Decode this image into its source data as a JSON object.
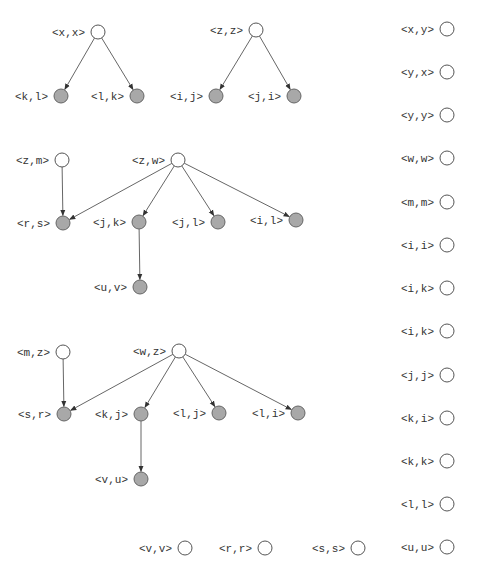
{
  "colors": {
    "filled_node": "#a8a8a8",
    "empty_node": "#ffffff",
    "edge": "#555555",
    "text": "#333333"
  },
  "nodes": [
    {
      "id": "xx",
      "label": "<x,x>",
      "x": 98,
      "y": 32,
      "filled": false
    },
    {
      "id": "kl",
      "label": "<k,l>",
      "x": 61,
      "y": 96,
      "filled": true
    },
    {
      "id": "lk",
      "label": "<l,k>",
      "x": 137,
      "y": 96,
      "filled": true
    },
    {
      "id": "zz",
      "label": "<z,z>",
      "x": 256,
      "y": 30,
      "filled": false
    },
    {
      "id": "ij",
      "label": "<i,j>",
      "x": 216,
      "y": 96,
      "filled": true
    },
    {
      "id": "ji",
      "label": "<j,i>",
      "x": 294,
      "y": 96,
      "filled": true
    },
    {
      "id": "zm",
      "label": "<z,m>",
      "x": 62,
      "y": 160,
      "filled": false
    },
    {
      "id": "zw",
      "label": "<z,w>",
      "x": 178,
      "y": 160,
      "filled": false
    },
    {
      "id": "rs",
      "label": "<r,s>",
      "x": 63,
      "y": 223,
      "filled": true
    },
    {
      "id": "jk",
      "label": "<j,k>",
      "x": 139,
      "y": 222,
      "filled": true
    },
    {
      "id": "jl",
      "label": "<j,l>",
      "x": 218,
      "y": 222,
      "filled": true
    },
    {
      "id": "il",
      "label": "<i,l>",
      "x": 296,
      "y": 220,
      "filled": true
    },
    {
      "id": "uv",
      "label": "<u,v>",
      "x": 140,
      "y": 287,
      "filled": true
    },
    {
      "id": "mz",
      "label": "<m,z>",
      "x": 63,
      "y": 352,
      "filled": false
    },
    {
      "id": "wz",
      "label": "<w,z>",
      "x": 179,
      "y": 351,
      "filled": false
    },
    {
      "id": "sr",
      "label": "<s,r>",
      "x": 64,
      "y": 414,
      "filled": true
    },
    {
      "id": "kj",
      "label": "<k,j>",
      "x": 141,
      "y": 414,
      "filled": true
    },
    {
      "id": "lj",
      "label": "<l,j>",
      "x": 219,
      "y": 413,
      "filled": true
    },
    {
      "id": "li",
      "label": "<l,i>",
      "x": 298,
      "y": 413,
      "filled": true
    },
    {
      "id": "vu",
      "label": "<v,u>",
      "x": 141,
      "y": 479,
      "filled": true
    },
    {
      "id": "xy",
      "label": "<x,y>",
      "x": 447,
      "y": 29,
      "filled": false
    },
    {
      "id": "yx",
      "label": "<y,x>",
      "x": 447,
      "y": 72,
      "filled": false
    },
    {
      "id": "yy",
      "label": "<y,y>",
      "x": 447,
      "y": 115,
      "filled": false
    },
    {
      "id": "ww",
      "label": "<w,w>",
      "x": 447,
      "y": 158,
      "filled": false
    },
    {
      "id": "mm",
      "label": "<m,m>",
      "x": 447,
      "y": 202,
      "filled": false
    },
    {
      "id": "ii",
      "label": "<i,i>",
      "x": 447,
      "y": 245,
      "filled": false
    },
    {
      "id": "ik1",
      "label": "<i,k>",
      "x": 447,
      "y": 288,
      "filled": false
    },
    {
      "id": "ik2",
      "label": "<i,k>",
      "x": 447,
      "y": 331,
      "filled": false
    },
    {
      "id": "jj",
      "label": "<j,j>",
      "x": 447,
      "y": 375,
      "filled": false
    },
    {
      "id": "ki",
      "label": "<k,i>",
      "x": 447,
      "y": 418,
      "filled": false
    },
    {
      "id": "kk",
      "label": "<k,k>",
      "x": 447,
      "y": 461,
      "filled": false
    },
    {
      "id": "ll",
      "label": "<l,l>",
      "x": 447,
      "y": 504,
      "filled": false
    },
    {
      "id": "uu",
      "label": "<u,u>",
      "x": 447,
      "y": 547,
      "filled": false
    },
    {
      "id": "vv",
      "label": "<v,v>",
      "x": 185,
      "y": 548,
      "filled": false
    },
    {
      "id": "rr",
      "label": "<r,r>",
      "x": 265,
      "y": 548,
      "filled": false
    },
    {
      "id": "ss",
      "label": "<s,s>",
      "x": 358,
      "y": 548,
      "filled": false
    }
  ],
  "edges": [
    {
      "from": "xx",
      "to": "kl"
    },
    {
      "from": "xx",
      "to": "lk"
    },
    {
      "from": "zz",
      "to": "ij"
    },
    {
      "from": "zz",
      "to": "ji"
    },
    {
      "from": "zm",
      "to": "rs"
    },
    {
      "from": "zw",
      "to": "rs"
    },
    {
      "from": "zw",
      "to": "jk"
    },
    {
      "from": "zw",
      "to": "jl"
    },
    {
      "from": "zw",
      "to": "il"
    },
    {
      "from": "jk",
      "to": "uv"
    },
    {
      "from": "mz",
      "to": "sr"
    },
    {
      "from": "wz",
      "to": "sr"
    },
    {
      "from": "wz",
      "to": "kj"
    },
    {
      "from": "wz",
      "to": "lj"
    },
    {
      "from": "wz",
      "to": "li"
    },
    {
      "from": "kj",
      "to": "vu"
    }
  ],
  "node_radius": 7
}
